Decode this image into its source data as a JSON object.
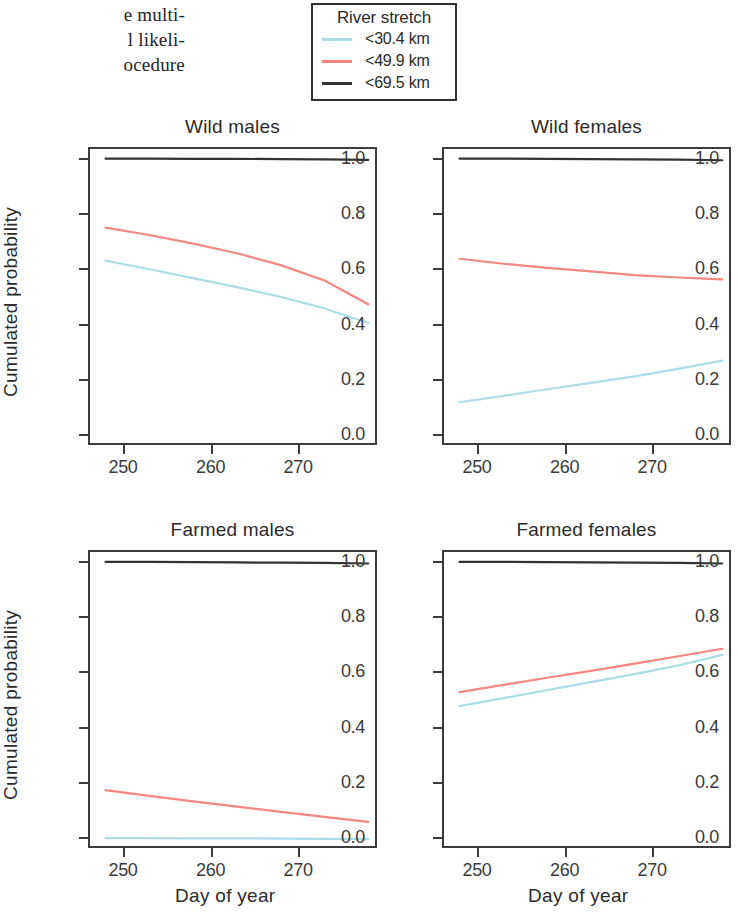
{
  "page_text": {
    "lines": [
      "e multi-",
      "l likeli-",
      "ocedure"
    ]
  },
  "legend": {
    "title": "River stretch",
    "entries": [
      {
        "label": "<30.4 km",
        "color": "#aadde6"
      },
      {
        "label": "<49.9 km",
        "color": "#f4877f"
      },
      {
        "label": "<69.5 km",
        "color": "#333333"
      }
    ]
  },
  "axes": {
    "ylabel": "Cumulated probability",
    "xlabel": "Day of year",
    "ytick_labels": [
      "0.0",
      "0.2",
      "0.4",
      "0.6",
      "0.8",
      "1.0"
    ],
    "xtick_labels": [
      "250",
      "260",
      "270"
    ]
  },
  "chart_data": {
    "type": "line",
    "title": "",
    "xlabel": "Day of year",
    "ylabel": "Cumulated probability",
    "xlim": [
      246,
      279
    ],
    "ylim": [
      -0.04,
      1.04
    ],
    "xticks": [
      250,
      260,
      270
    ],
    "yticks": [
      0.0,
      0.2,
      0.4,
      0.6,
      0.8,
      1.0
    ],
    "grid": false,
    "legend": "River stretch",
    "legend_position": "top-center",
    "panel_layout": "2x2",
    "panels": [
      {
        "title": "Wild males",
        "x": [
          248,
          253,
          258,
          263,
          268,
          273,
          278
        ],
        "series": [
          {
            "name": "<30.4 km",
            "color": "#aadde6",
            "values": [
              0.628,
              0.597,
              0.565,
              0.532,
              0.497,
              0.455,
              0.402
            ]
          },
          {
            "name": "<49.9 km",
            "color": "#f4877f",
            "values": [
              0.748,
              0.721,
              0.69,
              0.655,
              0.612,
              0.556,
              0.47
            ]
          },
          {
            "name": "<69.5 km",
            "color": "#333333",
            "values": [
              0.998,
              0.998,
              0.997,
              0.997,
              0.996,
              0.995,
              0.993
            ]
          }
        ]
      },
      {
        "title": "Wild females",
        "x": [
          248,
          253,
          258,
          263,
          268,
          273,
          278
        ],
        "series": [
          {
            "name": "<30.4 km",
            "color": "#aadde6",
            "values": [
              0.115,
              0.138,
              0.162,
              0.185,
              0.209,
              0.236,
              0.266
            ]
          },
          {
            "name": "<49.9 km",
            "color": "#f4877f",
            "values": [
              0.635,
              0.617,
              0.602,
              0.589,
              0.576,
              0.567,
              0.56
            ]
          },
          {
            "name": "<69.5 km",
            "color": "#333333",
            "values": [
              0.998,
              0.998,
              0.997,
              0.996,
              0.995,
              0.994,
              0.992
            ]
          }
        ]
      },
      {
        "title": "Farmed males",
        "x": [
          248,
          253,
          258,
          263,
          268,
          273,
          278
        ],
        "series": [
          {
            "name": "<30.4 km",
            "color": "#aadde6",
            "values": [
              -0.004,
              -0.004,
              -0.005,
              -0.005,
              -0.006,
              -0.007,
              -0.008
            ]
          },
          {
            "name": "<49.9 km",
            "color": "#f4877f",
            "values": [
              0.17,
              0.149,
              0.129,
              0.11,
              0.091,
              0.073,
              0.055
            ]
          },
          {
            "name": "<69.5 km",
            "color": "#333333",
            "values": [
              0.997,
              0.997,
              0.996,
              0.995,
              0.994,
              0.993,
              0.991
            ]
          }
        ]
      },
      {
        "title": "Farmed females",
        "x": [
          248,
          253,
          258,
          263,
          268,
          273,
          278
        ],
        "series": [
          {
            "name": "<30.4 km",
            "color": "#aadde6",
            "values": [
              0.474,
              0.503,
              0.532,
              0.561,
              0.59,
              0.622,
              0.66
            ]
          },
          {
            "name": "<49.9 km",
            "color": "#f4877f",
            "values": [
              0.525,
              0.551,
              0.577,
              0.602,
              0.628,
              0.655,
              0.682
            ]
          },
          {
            "name": "<69.5 km",
            "color": "#333333",
            "values": [
              0.997,
              0.997,
              0.996,
              0.995,
              0.994,
              0.993,
              0.991
            ]
          }
        ]
      }
    ]
  }
}
